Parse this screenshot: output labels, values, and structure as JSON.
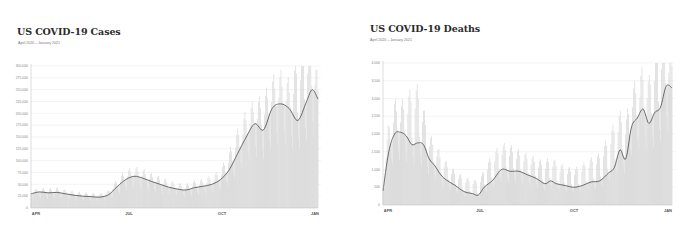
{
  "cases_panel": {
    "title": "US COVID-19 Cases",
    "subtitle": "April 2020 – January 2021"
  },
  "deaths_panel": {
    "title": "US COVID-19 Deaths",
    "subtitle": "April 2020 – January 2021"
  },
  "colors": {
    "bar": "#d9d9d9",
    "area": "#e6e6e6",
    "line": "#4a4a4a",
    "grid": "#ececec",
    "axis": "#bbbbbb"
  },
  "chart_data": [
    {
      "type": "bar",
      "title": "US COVID-19 Cases",
      "subtitle": "April 2020 – January 2021",
      "xlabel": "",
      "ylabel": "",
      "ylim": [
        0,
        300000
      ],
      "yticks": [
        0,
        25000,
        50000,
        75000,
        100000,
        125000,
        150000,
        175000,
        200000,
        225000,
        250000,
        275000,
        300000
      ],
      "ytick_labels": [
        "0",
        "25,000",
        "50,000",
        "75,000",
        "100,000",
        "125,000",
        "150,000",
        "175,000",
        "200,000",
        "225,000",
        "250,000",
        "275,000",
        "300,000"
      ],
      "xtick_labels": [
        "APR",
        "JUL",
        "OCT",
        "JAN"
      ],
      "grid": true,
      "legend": null,
      "series": [
        {
          "name": "7-day average",
          "kind": "line",
          "x_frac": [
            0.0,
            0.03,
            0.06,
            0.09,
            0.12,
            0.15,
            0.18,
            0.21,
            0.24,
            0.27,
            0.3,
            0.33,
            0.36,
            0.39,
            0.42,
            0.45,
            0.48,
            0.51,
            0.54,
            0.57,
            0.6,
            0.63,
            0.66,
            0.69,
            0.72,
            0.75,
            0.78,
            0.81,
            0.84,
            0.87,
            0.9,
            0.93,
            0.96,
            0.98,
            1.0
          ],
          "values": [
            30000,
            34000,
            32000,
            33000,
            30000,
            27000,
            25000,
            24000,
            23000,
            28000,
            45000,
            60000,
            67000,
            63000,
            56000,
            50000,
            44000,
            40000,
            38000,
            43000,
            46000,
            50000,
            60000,
            80000,
            115000,
            150000,
            178000,
            165000,
            210000,
            220000,
            210000,
            185000,
            225000,
            250000,
            230000
          ]
        },
        {
          "name": "Daily cases",
          "kind": "bar",
          "x_frac": [
            0.0,
            0.03,
            0.06,
            0.09,
            0.12,
            0.15,
            0.18,
            0.21,
            0.24,
            0.27,
            0.3,
            0.33,
            0.36,
            0.39,
            0.42,
            0.45,
            0.48,
            0.51,
            0.54,
            0.57,
            0.6,
            0.63,
            0.66,
            0.69,
            0.72,
            0.75,
            0.78,
            0.81,
            0.84,
            0.87,
            0.9,
            0.93,
            0.96,
            0.98,
            1.0
          ],
          "values": [
            33000,
            36000,
            35000,
            37000,
            33000,
            30000,
            28000,
            27000,
            26000,
            32000,
            52000,
            68000,
            74000,
            70000,
            62000,
            56000,
            50000,
            45000,
            43000,
            49000,
            52000,
            58000,
            70000,
            100000,
            140000,
            175000,
            195000,
            200000,
            235000,
            245000,
            230000,
            270000,
            290000,
            300000,
            235000
          ]
        }
      ]
    },
    {
      "type": "bar",
      "title": "US COVID-19 Deaths",
      "subtitle": "April 2020 – January 2021",
      "xlabel": "",
      "ylabel": "",
      "ylim": [
        0,
        4000
      ],
      "yticks": [
        0,
        500,
        1000,
        1500,
        2000,
        2500,
        3000,
        3500,
        4000
      ],
      "ytick_labels": [
        "0",
        "500",
        "1,000",
        "1,500",
        "2,000",
        "2,500",
        "3,000",
        "3,500",
        "4,000"
      ],
      "xtick_labels": [
        "APR",
        "JUL",
        "OCT",
        "JAN"
      ],
      "grid": true,
      "legend": null,
      "series": [
        {
          "name": "7-day average",
          "kind": "line",
          "x_frac": [
            0.0,
            0.02,
            0.04,
            0.06,
            0.08,
            0.1,
            0.12,
            0.14,
            0.16,
            0.18,
            0.2,
            0.22,
            0.25,
            0.28,
            0.31,
            0.33,
            0.35,
            0.38,
            0.41,
            0.44,
            0.47,
            0.5,
            0.53,
            0.56,
            0.58,
            0.6,
            0.63,
            0.66,
            0.69,
            0.72,
            0.75,
            0.78,
            0.8,
            0.82,
            0.84,
            0.86,
            0.88,
            0.9,
            0.92,
            0.94,
            0.96,
            0.98,
            1.0
          ],
          "values": [
            400,
            1500,
            2000,
            2050,
            1950,
            1700,
            1750,
            1700,
            1300,
            1100,
            850,
            700,
            550,
            380,
            320,
            280,
            500,
            700,
            1000,
            950,
            950,
            850,
            750,
            600,
            680,
            600,
            550,
            500,
            550,
            650,
            680,
            900,
            1050,
            1550,
            1300,
            2200,
            2450,
            2700,
            2300,
            2600,
            2750,
            3350,
            3300
          ]
        },
        {
          "name": "Daily deaths",
          "kind": "bar",
          "x_frac": [
            0.0,
            0.02,
            0.04,
            0.06,
            0.08,
            0.1,
            0.12,
            0.14,
            0.16,
            0.18,
            0.2,
            0.22,
            0.25,
            0.28,
            0.31,
            0.33,
            0.35,
            0.38,
            0.41,
            0.44,
            0.47,
            0.5,
            0.53,
            0.56,
            0.58,
            0.6,
            0.63,
            0.66,
            0.69,
            0.72,
            0.75,
            0.78,
            0.8,
            0.82,
            0.84,
            0.86,
            0.88,
            0.9,
            0.92,
            0.94,
            0.96,
            0.98,
            1.0
          ],
          "values": [
            600,
            2000,
            2500,
            2400,
            2600,
            2700,
            2800,
            2300,
            1700,
            1500,
            1200,
            1000,
            800,
            650,
            600,
            550,
            850,
            1200,
            1450,
            1400,
            1300,
            1200,
            1100,
            1000,
            1150,
            1000,
            900,
            850,
            950,
            1100,
            1200,
            1600,
            1900,
            2200,
            2000,
            2800,
            3000,
            3300,
            3000,
            3600,
            3900,
            4000,
            3700
          ]
        }
      ]
    }
  ]
}
